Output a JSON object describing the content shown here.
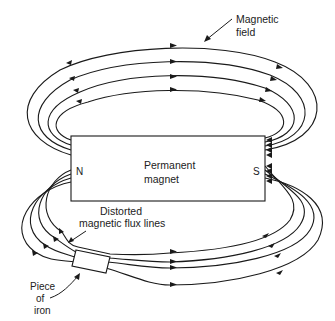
{
  "diagram": {
    "type": "magnetic-field-diagram",
    "labels": {
      "magnetic_field": [
        "Magnetic",
        "field"
      ],
      "magnet": [
        "Permanent",
        "magnet"
      ],
      "north_pole": "N",
      "south_pole": "S",
      "distorted": [
        "Distorted",
        "magnetic flux lines"
      ],
      "iron": [
        "Piece",
        "of",
        "iron"
      ]
    },
    "colors": {
      "line": "#1a1a1a",
      "text": "#222222",
      "background": "#ffffff"
    }
  }
}
